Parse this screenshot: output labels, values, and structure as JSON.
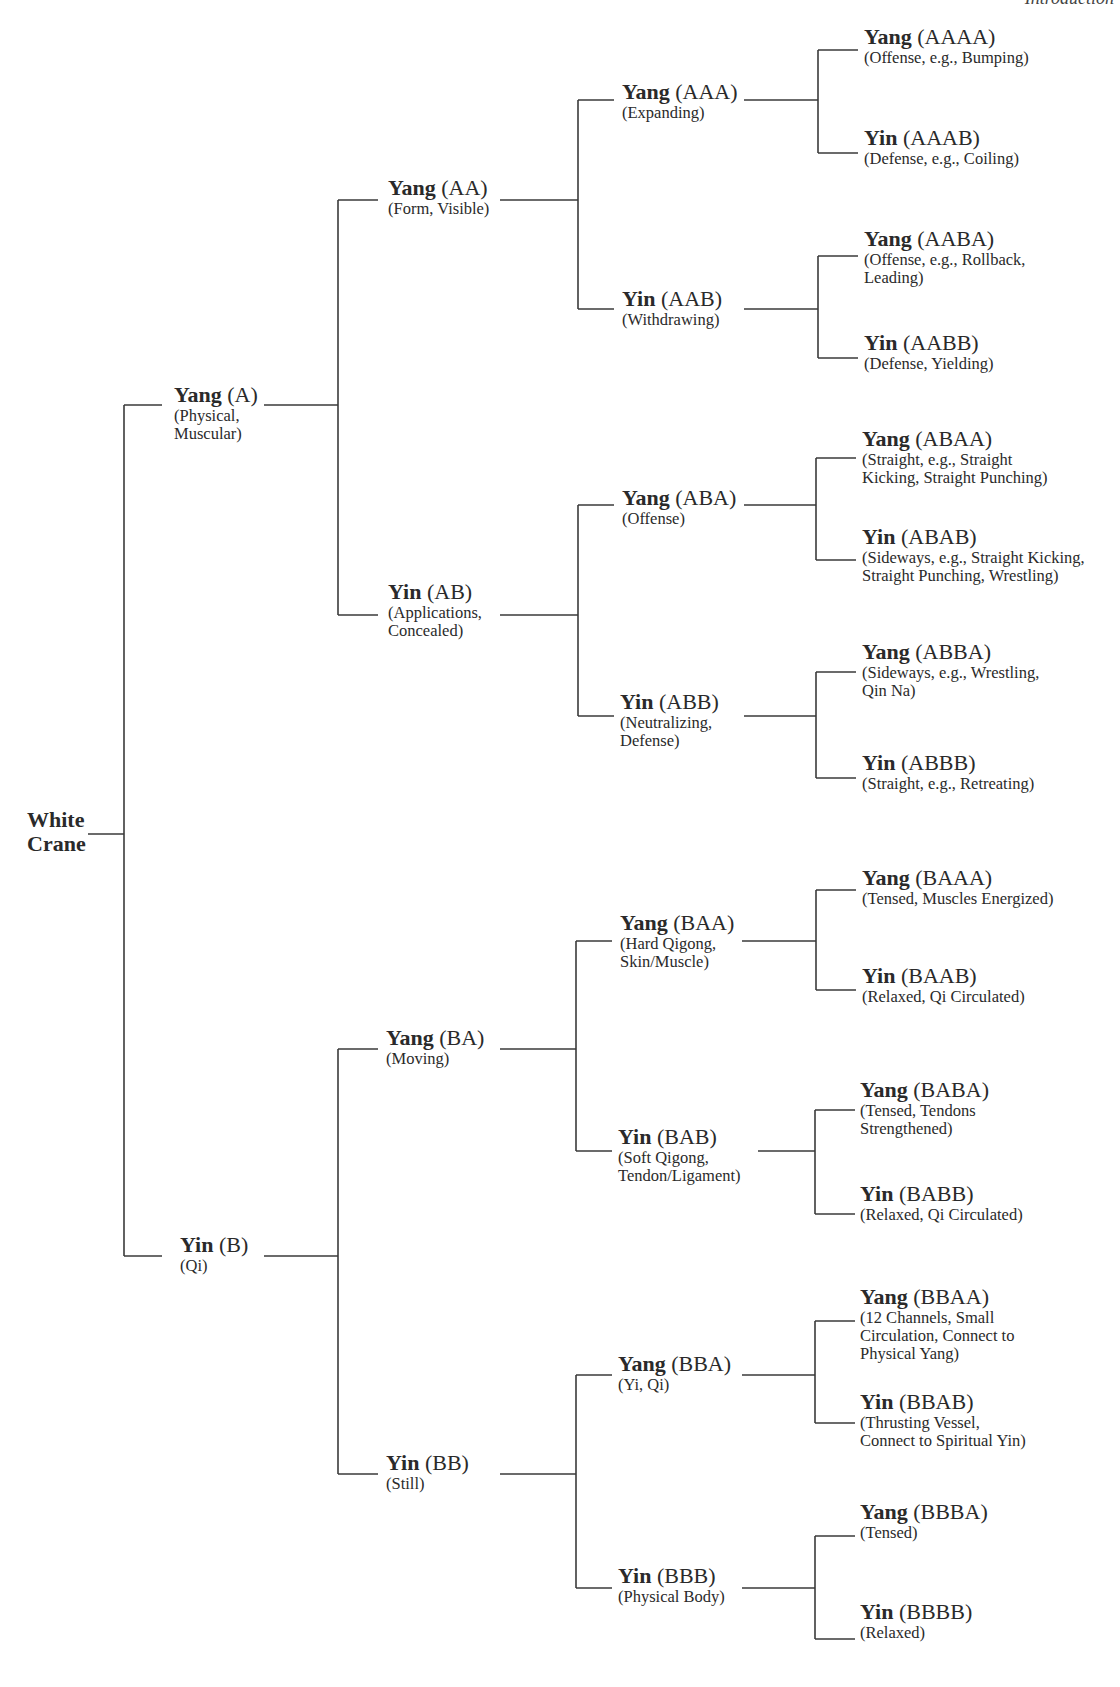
{
  "header": {
    "text": "Introduction"
  },
  "root": {
    "label": "White\nCrane"
  },
  "nodes": [
    {
      "id": "A",
      "x": 174,
      "y": 383,
      "pole": "Yang",
      "code": "(A)",
      "desc": "(Physical,\nMuscular)"
    },
    {
      "id": "B",
      "x": 180,
      "y": 1233,
      "pole": "Yin",
      "code": "(B)",
      "desc": "(Qi)"
    },
    {
      "id": "AA",
      "x": 388,
      "y": 176,
      "pole": "Yang",
      "code": "(AA)",
      "desc": "(Form, Visible)"
    },
    {
      "id": "AB",
      "x": 388,
      "y": 580,
      "pole": "Yin",
      "code": "(AB)",
      "desc": "(Applications,\nConcealed)"
    },
    {
      "id": "BA",
      "x": 386,
      "y": 1026,
      "pole": "Yang",
      "code": "(BA)",
      "desc": "(Moving)"
    },
    {
      "id": "BB",
      "x": 386,
      "y": 1451,
      "pole": "Yin",
      "code": "(BB)",
      "desc": "(Still)"
    },
    {
      "id": "AAA",
      "x": 622,
      "y": 80,
      "pole": "Yang",
      "code": "(AAA)",
      "desc": "(Expanding)"
    },
    {
      "id": "AAB",
      "x": 622,
      "y": 287,
      "pole": "Yin",
      "code": "(AAB)",
      "desc": "(Withdrawing)"
    },
    {
      "id": "ABA",
      "x": 622,
      "y": 486,
      "pole": "Yang",
      "code": "(ABA)",
      "desc": "(Offense)"
    },
    {
      "id": "ABB",
      "x": 620,
      "y": 690,
      "pole": "Yin",
      "code": "(ABB)",
      "desc": "(Neutralizing,\nDefense)"
    },
    {
      "id": "BAA",
      "x": 620,
      "y": 911,
      "pole": "Yang",
      "code": "(BAA)",
      "desc": "(Hard Qigong,\nSkin/Muscle)"
    },
    {
      "id": "BAB",
      "x": 618,
      "y": 1125,
      "pole": "Yin",
      "code": "(BAB)",
      "desc": "(Soft Qigong,\nTendon/Ligament)"
    },
    {
      "id": "BBA",
      "x": 618,
      "y": 1352,
      "pole": "Yang",
      "code": "(BBA)",
      "desc": "(Yi, Qi)"
    },
    {
      "id": "BBB",
      "x": 618,
      "y": 1564,
      "pole": "Yin",
      "code": "(BBB)",
      "desc": "(Physical Body)"
    },
    {
      "id": "AAAA",
      "x": 864,
      "y": 25,
      "pole": "Yang",
      "code": "(AAAA)",
      "desc": "(Offense, e.g., Bumping)"
    },
    {
      "id": "AAAB",
      "x": 864,
      "y": 126,
      "pole": "Yin",
      "code": "(AAAB)",
      "desc": "(Defense, e.g., Coiling)"
    },
    {
      "id": "AABA",
      "x": 864,
      "y": 227,
      "pole": "Yang",
      "code": "(AABA)",
      "desc": "(Offense,  e.g.,  Rollback,\nLeading)"
    },
    {
      "id": "AABB",
      "x": 864,
      "y": 331,
      "pole": "Yin",
      "code": "(AABB)",
      "desc": "(Defense, Yielding)"
    },
    {
      "id": "ABAA",
      "x": 862,
      "y": 427,
      "pole": "Yang",
      "code": "(ABAA)",
      "desc": "(Straight, e.g., Straight\nKicking, Straight Punching)"
    },
    {
      "id": "ABAB",
      "x": 862,
      "y": 525,
      "pole": "Yin",
      "code": "(ABAB)",
      "desc": "(Sideways, e.g., Straight Kicking,\nStraight Punching, Wrestling)"
    },
    {
      "id": "ABBA",
      "x": 862,
      "y": 640,
      "pole": "Yang",
      "code": "(ABBA)",
      "desc": "(Sideways, e.g., Wrestling,\nQin Na)"
    },
    {
      "id": "ABBB",
      "x": 862,
      "y": 751,
      "pole": "Yin",
      "code": "(ABBB)",
      "desc": "(Straight, e.g., Retreating)"
    },
    {
      "id": "BAAA",
      "x": 862,
      "y": 866,
      "pole": "Yang",
      "code": "(BAAA)",
      "desc": "(Tensed, Muscles Energized)"
    },
    {
      "id": "BAAB",
      "x": 862,
      "y": 964,
      "pole": "Yin",
      "code": "(BAAB)",
      "desc": "(Relaxed, Qi Circulated)"
    },
    {
      "id": "BABA",
      "x": 860,
      "y": 1078,
      "pole": "Yang",
      "code": "(BABA)",
      "desc": "(Tensed, Tendons\nStrengthened)"
    },
    {
      "id": "BABB",
      "x": 860,
      "y": 1182,
      "pole": "Yin",
      "code": "(BABB)",
      "desc": "(Relaxed, Qi Circulated)"
    },
    {
      "id": "BBAA",
      "x": 860,
      "y": 1285,
      "pole": "Yang",
      "code": "(BBAA)",
      "desc": "(12 Channels, Small\nCirculation, Connect to\nPhysical Yang)"
    },
    {
      "id": "BBAB",
      "x": 860,
      "y": 1390,
      "pole": "Yin",
      "code": "(BBAB)",
      "desc": "(Thrusting Vessel,\nConnect to Spiritual Yin)"
    },
    {
      "id": "BBBA",
      "x": 860,
      "y": 1500,
      "pole": "Yang",
      "code": "(BBBA)",
      "desc": "(Tensed)"
    },
    {
      "id": "BBBB",
      "x": 860,
      "y": 1600,
      "pole": "Yin",
      "code": "(BBBB)",
      "desc": "(Relaxed)"
    }
  ],
  "colors": {
    "line": "#3a3a3a",
    "text": "#2a2a2a",
    "background": "#ffffff"
  }
}
